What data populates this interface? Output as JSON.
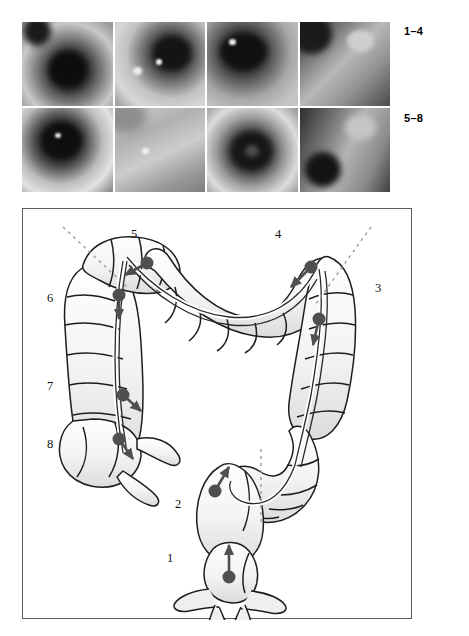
{
  "figure": {
    "row_labels": {
      "top": "1–4",
      "bottom": "5–8"
    },
    "photo_tiles": [
      {
        "id": 1,
        "alt": "endoscopic-view-1"
      },
      {
        "id": 2,
        "alt": "endoscopic-view-2"
      },
      {
        "id": 3,
        "alt": "endoscopic-view-3"
      },
      {
        "id": 4,
        "alt": "endoscopic-view-4"
      },
      {
        "id": 5,
        "alt": "endoscopic-view-5"
      },
      {
        "id": 6,
        "alt": "endoscopic-view-6"
      },
      {
        "id": 7,
        "alt": "endoscopic-view-7"
      },
      {
        "id": 8,
        "alt": "endoscopic-view-8"
      }
    ],
    "diagram": {
      "position_labels": [
        "1",
        "2",
        "3",
        "4",
        "5",
        "6",
        "7",
        "8"
      ],
      "marker_color": "#4f4f4f",
      "outline_color": "#1d1d1d",
      "fill_color": "#f2f2f2",
      "dotted_line_color": "#9a9a9a",
      "border_color": "#5a5a5a"
    },
    "caption": ""
  }
}
